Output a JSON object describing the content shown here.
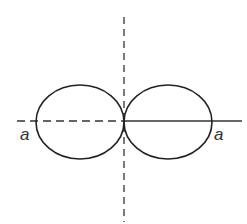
{
  "diagram": {
    "type": "polar-curve-two-lobes",
    "center": {
      "x": 124,
      "y": 121
    },
    "left_lobe": {
      "cx": 80,
      "cy": 122,
      "rx": 44,
      "ry": 37
    },
    "right_lobe": {
      "cx": 168,
      "cy": 122,
      "rx": 44,
      "ry": 37
    },
    "axes": {
      "vertical": {
        "style": "dashed",
        "x": 124,
        "y1": 17,
        "y2": 222
      },
      "horizontal_left": {
        "style": "dashed",
        "x1": 17,
        "x2": 124,
        "y": 121
      },
      "horizontal_right": {
        "style": "solid",
        "x1": 124,
        "x2": 242,
        "y": 121
      }
    },
    "labels": [
      {
        "id": "left-a",
        "text": "a",
        "x": 20,
        "y": 126
      },
      {
        "id": "right-a",
        "text": "a",
        "x": 214,
        "y": 126
      }
    ],
    "stroke_color": "#222222"
  }
}
